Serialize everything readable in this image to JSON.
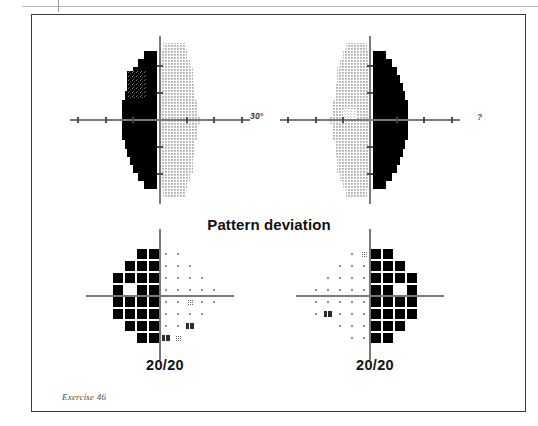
{
  "page": {
    "caption": "Exercise 46",
    "has_top_rule": true
  },
  "figure": {
    "title": "Pattern deviation",
    "degree_label": "30°",
    "degree_label_right": "?",
    "colors": {
      "defect_black": "#000000",
      "grayscale_dots": "#b9b9b9",
      "axis_gray": "#7a7a7a",
      "frame": "#3b3b3b",
      "paper": "#ffffff"
    }
  },
  "grayscale_plots": [
    {
      "eye": "left",
      "name": "grayscale-plot-left",
      "defect_side": "left",
      "description": "Dense black hemianopic defect occupying the left (nasal) half of the 30-degree field, both upper and lower quadrants; a lighter mottled patch sits in the upper-left periphery.",
      "center_x": 160,
      "center_y": 120,
      "axis_extent_deg": 30,
      "rows": [
        {
          "y": -27,
          "gray_from": 1,
          "gray_to": 9,
          "black_from": null,
          "black_to": null
        },
        {
          "y": -24,
          "gray_from": 0,
          "gray_to": 10,
          "black_from": -6,
          "black_to": -1
        },
        {
          "y": -21,
          "gray_from": 0,
          "gray_to": 11,
          "black_from": -8,
          "black_to": -1
        },
        {
          "y": -18,
          "gray_from": 0,
          "gray_to": 12,
          "black_from": -10,
          "black_to": -1
        },
        {
          "y": -15,
          "gray_from": 0,
          "gray_to": 12,
          "black_from": -11,
          "black_to": -1
        },
        {
          "y": -12,
          "gray_from": 0,
          "gray_to": 13,
          "black_from": -12,
          "black_to": -1
        },
        {
          "y": -9,
          "gray_from": 0,
          "gray_to": 13,
          "black_from": -13,
          "black_to": -1
        },
        {
          "y": -6,
          "gray_from": 0,
          "gray_to": 14,
          "black_from": -14,
          "black_to": -1
        },
        {
          "y": -3,
          "gray_from": 0,
          "gray_to": 14,
          "black_from": -14,
          "black_to": -1
        },
        {
          "y": 0,
          "gray_from": 0,
          "gray_to": 15,
          "black_from": -14,
          "black_to": -1
        },
        {
          "y": 3,
          "gray_from": 0,
          "gray_to": 14,
          "black_from": -14,
          "black_to": -1
        },
        {
          "y": 6,
          "gray_from": 0,
          "gray_to": 14,
          "black_from": -14,
          "black_to": -1
        },
        {
          "y": 9,
          "gray_from": 0,
          "gray_to": 13,
          "black_from": -13,
          "black_to": -1
        },
        {
          "y": 12,
          "gray_from": 0,
          "gray_to": 13,
          "black_from": -12,
          "black_to": -1
        },
        {
          "y": 15,
          "gray_from": 0,
          "gray_to": 12,
          "black_from": -11,
          "black_to": -1
        },
        {
          "y": 18,
          "gray_from": 0,
          "gray_to": 12,
          "black_from": -10,
          "black_to": -1
        },
        {
          "y": 21,
          "gray_from": 0,
          "gray_to": 11,
          "black_from": -8,
          "black_to": -1
        },
        {
          "y": 24,
          "gray_from": 0,
          "gray_to": 10,
          "black_from": -6,
          "black_to": -1
        },
        {
          "y": 27,
          "gray_from": 1,
          "gray_to": 9,
          "black_from": null,
          "black_to": null
        }
      ],
      "mottled_patch": {
        "x_from": -12,
        "x_to": -5,
        "y_from": -18,
        "y_to": -8
      }
    },
    {
      "eye": "right",
      "name": "grayscale-plot-right",
      "defect_side": "right",
      "description": "Dense black hemianopic defect occupying the right half of the 30-degree field, both upper and lower quadrants; blind-spot mottling appears to the left of fixation.",
      "center_x": 370,
      "center_y": 120,
      "axis_extent_deg": 30,
      "rows": [
        {
          "y": -27,
          "gray_from": -9,
          "gray_to": -1,
          "black_from": null,
          "black_to": null
        },
        {
          "y": -24,
          "gray_from": -10,
          "gray_to": 0,
          "black_from": 1,
          "black_to": 6
        },
        {
          "y": -21,
          "gray_from": -11,
          "gray_to": 0,
          "black_from": 1,
          "black_to": 8
        },
        {
          "y": -18,
          "gray_from": -12,
          "gray_to": 0,
          "black_from": 1,
          "black_to": 10
        },
        {
          "y": -15,
          "gray_from": -12,
          "gray_to": 0,
          "black_from": 1,
          "black_to": 11
        },
        {
          "y": -12,
          "gray_from": -13,
          "gray_to": 0,
          "black_from": 1,
          "black_to": 12
        },
        {
          "y": -9,
          "gray_from": -13,
          "gray_to": 0,
          "black_from": 1,
          "black_to": 13
        },
        {
          "y": -6,
          "gray_from": -14,
          "gray_to": 0,
          "black_from": 1,
          "black_to": 14
        },
        {
          "y": -3,
          "gray_from": -14,
          "gray_to": 0,
          "black_from": 1,
          "black_to": 14
        },
        {
          "y": 0,
          "gray_from": -15,
          "gray_to": 0,
          "black_from": 1,
          "black_to": 14
        },
        {
          "y": 3,
          "gray_from": -14,
          "gray_to": 0,
          "black_from": 1,
          "black_to": 14
        },
        {
          "y": 6,
          "gray_from": -14,
          "gray_to": 0,
          "black_from": 1,
          "black_to": 14
        },
        {
          "y": 9,
          "gray_from": -13,
          "gray_to": 0,
          "black_from": 1,
          "black_to": 13
        },
        {
          "y": 12,
          "gray_from": -13,
          "gray_to": 0,
          "black_from": 1,
          "black_to": 12
        },
        {
          "y": 15,
          "gray_from": -12,
          "gray_to": 0,
          "black_from": 1,
          "black_to": 11
        },
        {
          "y": 18,
          "gray_from": -12,
          "gray_to": 0,
          "black_from": 1,
          "black_to": 10
        },
        {
          "y": 21,
          "gray_from": -11,
          "gray_to": 0,
          "black_from": 1,
          "black_to": 8
        },
        {
          "y": 24,
          "gray_from": -10,
          "gray_to": 0,
          "black_from": 1,
          "black_to": 6
        },
        {
          "y": 27,
          "gray_from": -9,
          "gray_to": -1,
          "black_from": null,
          "black_to": null
        }
      ],
      "mottled_patch": {
        "x_from": -10,
        "x_to": -5,
        "y_from": -4,
        "y_to": 0
      }
    }
  ],
  "pattern_deviation_plots": [
    {
      "eye": "left",
      "name": "pattern-deviation-plot-left",
      "visual_acuity": "20/20",
      "defect_side": "left",
      "center_x": 160,
      "center_y": 296,
      "cell_pitch": 12,
      "grid": [
        {
          "row": 0,
          "cells": [
            {
              "x": -2,
              "sym": "filled"
            },
            {
              "x": -1,
              "sym": "filled"
            },
            {
              "x": 1,
              "sym": "dot"
            },
            {
              "x": 2,
              "sym": "dot"
            }
          ]
        },
        {
          "row": 1,
          "cells": [
            {
              "x": -3,
              "sym": "filled"
            },
            {
              "x": -2,
              "sym": "filled"
            },
            {
              "x": -1,
              "sym": "filled"
            },
            {
              "x": 1,
              "sym": "dot"
            },
            {
              "x": 2,
              "sym": "dot"
            },
            {
              "x": 3,
              "sym": "dot"
            }
          ]
        },
        {
          "row": 2,
          "cells": [
            {
              "x": -4,
              "sym": "filled"
            },
            {
              "x": -3,
              "sym": "filled"
            },
            {
              "x": -2,
              "sym": "filled"
            },
            {
              "x": -1,
              "sym": "filled"
            },
            {
              "x": 1,
              "sym": "dot"
            },
            {
              "x": 2,
              "sym": "dot"
            },
            {
              "x": 3,
              "sym": "dot"
            },
            {
              "x": 4,
              "sym": "dot"
            }
          ]
        },
        {
          "row": 3,
          "cells": [
            {
              "x": -4,
              "sym": "filled"
            },
            {
              "x": -2,
              "sym": "filled"
            },
            {
              "x": -1,
              "sym": "filled"
            },
            {
              "x": 1,
              "sym": "dot"
            },
            {
              "x": 2,
              "sym": "dot"
            },
            {
              "x": 3,
              "sym": "dot"
            },
            {
              "x": 4,
              "sym": "dot"
            },
            {
              "x": 5,
              "sym": "dot"
            }
          ]
        },
        {
          "row": 4,
          "cells": [
            {
              "x": -4,
              "sym": "filled"
            },
            {
              "x": -3,
              "sym": "filled"
            },
            {
              "x": -2,
              "sym": "filled"
            },
            {
              "x": -1,
              "sym": "filled"
            },
            {
              "x": 1,
              "sym": "dot"
            },
            {
              "x": 2,
              "sym": "dot"
            },
            {
              "x": 3,
              "sym": "halftone"
            },
            {
              "x": 4,
              "sym": "dot"
            },
            {
              "x": 5,
              "sym": "dot"
            }
          ]
        },
        {
          "row": 5,
          "cells": [
            {
              "x": -4,
              "sym": "filled"
            },
            {
              "x": -3,
              "sym": "filled"
            },
            {
              "x": -2,
              "sym": "filled"
            },
            {
              "x": -1,
              "sym": "filled"
            },
            {
              "x": 1,
              "sym": "dot"
            },
            {
              "x": 2,
              "sym": "dot"
            },
            {
              "x": 3,
              "sym": "dot"
            },
            {
              "x": 4,
              "sym": "dot"
            }
          ]
        },
        {
          "row": 6,
          "cells": [
            {
              "x": -3,
              "sym": "filled"
            },
            {
              "x": -2,
              "sym": "filled"
            },
            {
              "x": -1,
              "sym": "filled"
            },
            {
              "x": 1,
              "sym": "dot"
            },
            {
              "x": 2,
              "sym": "dot"
            },
            {
              "x": 3,
              "sym": "blindspot"
            }
          ]
        },
        {
          "row": 7,
          "cells": [
            {
              "x": -2,
              "sym": "filled"
            },
            {
              "x": -1,
              "sym": "filled"
            },
            {
              "x": 1,
              "sym": "blindspot"
            },
            {
              "x": 2,
              "sym": "halftone"
            }
          ]
        }
      ]
    },
    {
      "eye": "right",
      "name": "pattern-deviation-plot-right",
      "visual_acuity": "20/20",
      "defect_side": "right",
      "center_x": 370,
      "center_y": 296,
      "cell_pitch": 12,
      "grid": [
        {
          "row": 0,
          "cells": [
            {
              "x": -2,
              "sym": "dot"
            },
            {
              "x": -1,
              "sym": "halftone"
            },
            {
              "x": 1,
              "sym": "filled"
            },
            {
              "x": 2,
              "sym": "filled"
            }
          ]
        },
        {
          "row": 1,
          "cells": [
            {
              "x": -3,
              "sym": "dot"
            },
            {
              "x": -2,
              "sym": "dot"
            },
            {
              "x": -1,
              "sym": "dot"
            },
            {
              "x": 1,
              "sym": "filled"
            },
            {
              "x": 2,
              "sym": "filled"
            },
            {
              "x": 3,
              "sym": "filled"
            }
          ]
        },
        {
          "row": 2,
          "cells": [
            {
              "x": -4,
              "sym": "dot"
            },
            {
              "x": -3,
              "sym": "dot"
            },
            {
              "x": -2,
              "sym": "dot"
            },
            {
              "x": -1,
              "sym": "dot"
            },
            {
              "x": 1,
              "sym": "filled"
            },
            {
              "x": 2,
              "sym": "filled"
            },
            {
              "x": 3,
              "sym": "filled"
            },
            {
              "x": 4,
              "sym": "filled"
            }
          ]
        },
        {
          "row": 3,
          "cells": [
            {
              "x": -5,
              "sym": "dot"
            },
            {
              "x": -4,
              "sym": "dot"
            },
            {
              "x": -3,
              "sym": "dot"
            },
            {
              "x": -2,
              "sym": "dot"
            },
            {
              "x": -1,
              "sym": "dot"
            },
            {
              "x": 1,
              "sym": "filled"
            },
            {
              "x": 2,
              "sym": "filled"
            },
            {
              "x": 4,
              "sym": "filled"
            }
          ]
        },
        {
          "row": 4,
          "cells": [
            {
              "x": -5,
              "sym": "dot"
            },
            {
              "x": -4,
              "sym": "dot"
            },
            {
              "x": -3,
              "sym": "dot"
            },
            {
              "x": -2,
              "sym": "dot"
            },
            {
              "x": -1,
              "sym": "dot"
            },
            {
              "x": 1,
              "sym": "filled"
            },
            {
              "x": 2,
              "sym": "filled"
            },
            {
              "x": 3,
              "sym": "filled"
            },
            {
              "x": 4,
              "sym": "filled"
            }
          ]
        },
        {
          "row": 5,
          "cells": [
            {
              "x": -5,
              "sym": "dot"
            },
            {
              "x": -4,
              "sym": "blindspot"
            },
            {
              "x": -3,
              "sym": "dot"
            },
            {
              "x": -2,
              "sym": "dot"
            },
            {
              "x": -1,
              "sym": "dot"
            },
            {
              "x": 1,
              "sym": "filled"
            },
            {
              "x": 2,
              "sym": "filled"
            },
            {
              "x": 3,
              "sym": "filled"
            },
            {
              "x": 4,
              "sym": "filled"
            }
          ]
        },
        {
          "row": 6,
          "cells": [
            {
              "x": -3,
              "sym": "dot"
            },
            {
              "x": -2,
              "sym": "dot"
            },
            {
              "x": -1,
              "sym": "dot"
            },
            {
              "x": 1,
              "sym": "filled"
            },
            {
              "x": 2,
              "sym": "filled"
            },
            {
              "x": 3,
              "sym": "filled"
            }
          ]
        },
        {
          "row": 7,
          "cells": [
            {
              "x": -2,
              "sym": "dot"
            },
            {
              "x": -1,
              "sym": "dot"
            },
            {
              "x": 1,
              "sym": "filled"
            },
            {
              "x": 2,
              "sym": "filled"
            }
          ]
        }
      ]
    }
  ]
}
